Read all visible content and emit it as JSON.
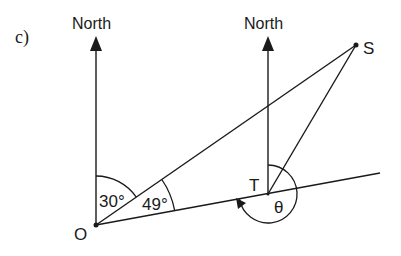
{
  "part_label": "c)",
  "north_labels": [
    "North",
    "North"
  ],
  "points": {
    "O": {
      "label": "O"
    },
    "T": {
      "label": "T"
    },
    "S": {
      "label": "S"
    }
  },
  "angles": {
    "north_to_OS": "30°",
    "OS_to_OT": "49°",
    "theta": "θ"
  },
  "colors": {
    "ink": "#1a1a1a",
    "background": "#ffffff"
  }
}
